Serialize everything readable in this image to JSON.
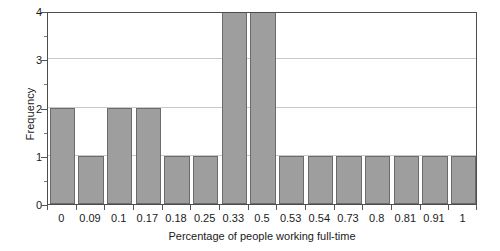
{
  "chart_data": {
    "type": "bar",
    "title": "",
    "subtitle": "",
    "xlabel": "Percentage of people working full-time",
    "ylabel": "Frequency",
    "categories": [
      "0",
      "0.09",
      "0.1",
      "0.17",
      "0.18",
      "0.25",
      "0.33",
      "0.5",
      "0.53",
      "0.54",
      "0.73",
      "0.8",
      "0.81",
      "0.91",
      "1"
    ],
    "values": [
      2,
      1,
      2,
      2,
      1,
      1,
      4,
      4,
      1,
      1,
      1,
      1,
      1,
      1,
      1
    ],
    "ylim": [
      0,
      4
    ],
    "y_ticks": [
      0,
      1,
      2,
      3,
      4
    ],
    "y_tick_labels": [
      "0",
      "1",
      "2",
      "3",
      "4"
    ],
    "y_minor_ticks": [
      0.5,
      1.5,
      2.5,
      3.5
    ],
    "grid": "horizontal",
    "legend": "none",
    "bar_color": "#9e9e9e",
    "bar_border_color": "#6b6b6b",
    "gridline_color": "#c9c9c9",
    "axis_color": "#4d4d4d",
    "background_color": "#ffffff"
  }
}
